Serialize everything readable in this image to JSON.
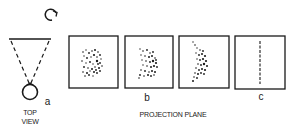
{
  "figure": {
    "top_view": {
      "rotation_icon": "clockwise-rotation-arrow",
      "object_label": "a",
      "caption_line1": "TOP",
      "caption_line2": "VIEW"
    },
    "projection_plane": {
      "caption": "PROJECTION PLANE",
      "panels": [
        {
          "id": "panel-1",
          "label": "",
          "pattern": "scattered-dots-square"
        },
        {
          "id": "panel-2",
          "label": "b",
          "pattern": "scattered-dots-compressed"
        },
        {
          "id": "panel-3",
          "label": "",
          "pattern": "scattered-dots-narrow"
        },
        {
          "id": "panel-4",
          "label": "c",
          "pattern": "vertical-line"
        }
      ]
    },
    "colors": {
      "ink": "#1a1a1a",
      "background": "#ffffff"
    }
  }
}
